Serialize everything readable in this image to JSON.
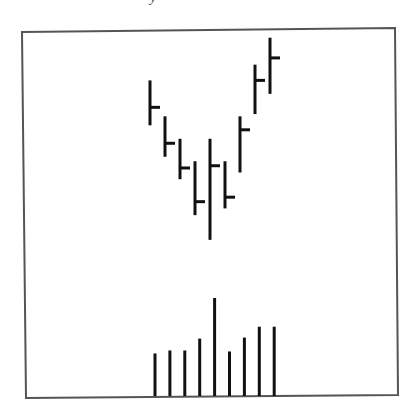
{
  "figure": {
    "caption_fragment": "y",
    "frame_color": "#555555",
    "ink_color": "#111111",
    "background": "#ffffff"
  },
  "chart_data": {
    "type": "ohlc",
    "title": "",
    "subtitle": "",
    "xlabel": "",
    "ylabel": "",
    "grid": false,
    "legend": null,
    "annotations": [],
    "price_panel": {
      "style": "HLC bars (vertical range line with right-side close tick)",
      "bars": [
        {
          "index": 1,
          "high": 100,
          "low": 80,
          "close": 88
        },
        {
          "index": 2,
          "high": 84,
          "low": 66,
          "close": 72
        },
        {
          "index": 3,
          "high": 74,
          "low": 56,
          "close": 61
        },
        {
          "index": 4,
          "high": 64,
          "low": 40,
          "close": 46
        },
        {
          "index": 5,
          "high": 74,
          "low": 29,
          "close": 62
        },
        {
          "index": 6,
          "high": 64,
          "low": 43,
          "close": 48
        },
        {
          "index": 7,
          "high": 84,
          "low": 59,
          "close": 78
        },
        {
          "index": 8,
          "high": 107,
          "low": 85,
          "close": 100
        },
        {
          "index": 9,
          "high": 119,
          "low": 94,
          "close": 110
        }
      ],
      "ylim": [
        0,
        130
      ]
    },
    "volume_panel": {
      "type": "bar",
      "categories": [
        1,
        2,
        3,
        4,
        5,
        6,
        7,
        8,
        9
      ],
      "values": [
        43,
        46,
        46,
        58,
        99,
        45,
        59,
        70,
        70
      ],
      "ylim": [
        0,
        100
      ]
    }
  }
}
